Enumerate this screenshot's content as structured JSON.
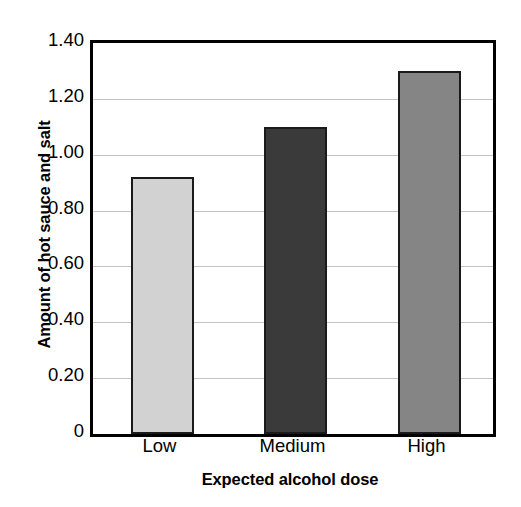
{
  "chart_data": {
    "type": "bar",
    "title": "",
    "subtitle": "",
    "xlabel": "Expected alcohol dose",
    "ylabel": "Amount of hot sauce and salt",
    "categories": [
      "Low",
      "Medium",
      "High"
    ],
    "values": [
      0.92,
      1.1,
      1.3
    ],
    "ylim": [
      0,
      1.4
    ],
    "ytick_values": [
      1.4,
      1.2,
      1.0,
      0.8,
      0.6,
      0.4,
      0.2,
      0
    ],
    "ytick_labels": [
      "1.40",
      "1.20",
      "1.00",
      "0.80",
      "0.60",
      "0.40",
      "0.20",
      "0"
    ],
    "grid": true,
    "grid_axis": "y",
    "legend": false,
    "legend_position": "none",
    "bar_colors": [
      "#d2d2d2",
      "#3a3a3a",
      "#858585"
    ],
    "bar_edge_color": "#1a1a1a",
    "grid_color": "#c4c4c4",
    "axis_color": "#000000",
    "background_color": "#ffffff",
    "bars": [
      {
        "category": "Low",
        "value": 0.92,
        "color": "#d2d2d2"
      },
      {
        "category": "Medium",
        "value": 1.1,
        "color": "#3a3a3a"
      },
      {
        "category": "High",
        "value": 1.3,
        "color": "#858585"
      }
    ]
  }
}
